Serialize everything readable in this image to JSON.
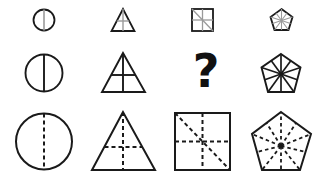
{
  "puzzle": {
    "rows": 3,
    "columns": 4,
    "colors": {
      "outline": "#1a1a1a",
      "inner_small": "#9a9a9a",
      "background": "#ffffff"
    },
    "cells": [
      {
        "row": 1,
        "col": 1,
        "shape": "circle",
        "size": "small",
        "inner_lines": "vertical diameter",
        "line_style": "solid gray"
      },
      {
        "row": 1,
        "col": 2,
        "shape": "triangle",
        "size": "small",
        "inner_lines": "vertical + horizontal",
        "line_style": "solid gray"
      },
      {
        "row": 1,
        "col": 3,
        "shape": "square",
        "size": "small",
        "inner_lines": "vertical + horizontal + diagonal",
        "line_style": "solid gray"
      },
      {
        "row": 1,
        "col": 4,
        "shape": "pentagon",
        "size": "small",
        "inner_lines": "5 vertex rays + 5 midpoint rays to center",
        "line_style": "solid gray"
      },
      {
        "row": 2,
        "col": 1,
        "shape": "circle",
        "size": "medium",
        "inner_lines": "vertical diameter",
        "line_style": "solid black"
      },
      {
        "row": 2,
        "col": 2,
        "shape": "triangle",
        "size": "medium",
        "inner_lines": "vertical + horizontal",
        "line_style": "solid black"
      },
      {
        "row": 2,
        "col": 3,
        "shape": "unknown",
        "size": "medium",
        "label": "?"
      },
      {
        "row": 2,
        "col": 4,
        "shape": "pentagon",
        "size": "medium",
        "inner_lines": "5 vertex rays + 5 midpoint rays to center",
        "line_style": "solid black"
      },
      {
        "row": 3,
        "col": 1,
        "shape": "circle",
        "size": "large",
        "inner_lines": "vertical diameter",
        "line_style": "dashed black"
      },
      {
        "row": 3,
        "col": 2,
        "shape": "triangle",
        "size": "large",
        "inner_lines": "vertical + horizontal",
        "line_style": "dashed black"
      },
      {
        "row": 3,
        "col": 3,
        "shape": "square",
        "size": "large",
        "inner_lines": "vertical + horizontal + diagonal",
        "line_style": "dashed black"
      },
      {
        "row": 3,
        "col": 4,
        "shape": "pentagon",
        "size": "large",
        "inner_lines": "5 vertex rays + 5 midpoint rays to center",
        "line_style": "dashed black"
      }
    ],
    "question_mark": "?"
  }
}
